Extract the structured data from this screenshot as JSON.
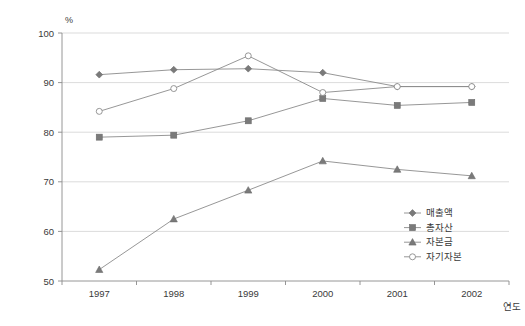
{
  "chart_data": {
    "type": "line",
    "title": "",
    "subtitle": "",
    "xlabel": "연도",
    "ylabel": "",
    "unit_label": "%",
    "categories": [
      "1997",
      "1998",
      "1999",
      "2000",
      "2001",
      "2002"
    ],
    "x": [
      1997,
      1998,
      1999,
      2000,
      2001,
      2002
    ],
    "ylim": [
      50,
      100
    ],
    "yticks": [
      50,
      60,
      70,
      80,
      90,
      100
    ],
    "ytick_labels": [
      "50",
      "60",
      "70",
      "80",
      "90",
      "100"
    ],
    "grid": true,
    "legend_position": "bottom-right",
    "series": [
      {
        "name": "매출액",
        "marker": "diamond",
        "values": [
          91.6,
          92.6,
          92.8,
          92.0,
          89.2,
          89.2
        ]
      },
      {
        "name": "총자산",
        "marker": "square",
        "values": [
          79.0,
          79.4,
          82.3,
          86.8,
          85.4,
          86.0
        ]
      },
      {
        "name": "자본금",
        "marker": "triangle",
        "values": [
          52.3,
          62.5,
          68.3,
          74.2,
          72.5,
          71.2
        ]
      },
      {
        "name": "자기자본",
        "marker": "circle-open",
        "values": [
          84.2,
          88.8,
          95.4,
          88.0,
          89.2,
          89.2
        ]
      }
    ]
  },
  "legend": {
    "items": [
      {
        "label": "매출액",
        "marker": "diamond"
      },
      {
        "label": "총자산",
        "marker": "square"
      },
      {
        "label": "자본금",
        "marker": "triangle"
      },
      {
        "label": "자기자본",
        "marker": "circle-open"
      }
    ]
  },
  "colors": {
    "line": "#8b8b8b",
    "marker_fill": "#7a7a7a",
    "marker_open_fill": "#ffffff",
    "grid": "#d2d2d2",
    "axis": "#8a8a8a",
    "text": "#3a3a3a",
    "background": "#ffffff"
  }
}
